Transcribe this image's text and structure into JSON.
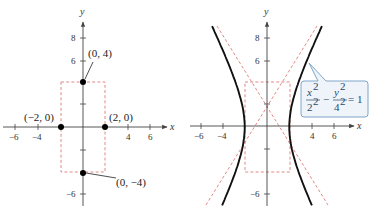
{
  "figures": [
    {
      "id": "left",
      "title": "Rectangle with vertices and co-vertices",
      "origin_px": [
        83,
        127
      ],
      "unit_px": [
        11.2,
        11.3
      ],
      "x_axis": {
        "label": "x",
        "ticks": [
          -6,
          -4,
          4,
          6
        ],
        "tick_labels": [
          "−6",
          "−4",
          "4",
          "6"
        ],
        "minor_ticks": [
          -2,
          2
        ]
      },
      "y_axis": {
        "label": "y",
        "ticks": [
          8,
          6,
          -6
        ],
        "tick_labels": [
          "8",
          "6",
          "−6"
        ],
        "minor_ticks": [
          2,
          -2
        ]
      },
      "rectangle": {
        "x": [
          -2,
          2
        ],
        "y": [
          -4,
          4
        ]
      },
      "points": [
        {
          "x": 0,
          "y": 4,
          "label": "(0, 4)"
        },
        {
          "x": -2,
          "y": 0,
          "label": "(−2, 0)"
        },
        {
          "x": 2,
          "y": 0,
          "label": "(2, 0)"
        },
        {
          "x": 0,
          "y": -4,
          "label": "(0, −4)"
        }
      ]
    },
    {
      "id": "right",
      "title": "Hyperbola with asymptotes",
      "origin_px": [
        267,
        127
      ],
      "unit_px": [
        11.15,
        11.2
      ],
      "x_axis": {
        "label": "x",
        "ticks": [
          -6,
          -4,
          4,
          6
        ],
        "tick_labels": [
          "−6",
          "−4",
          "4",
          "6"
        ],
        "minor_ticks": [
          -2,
          2
        ]
      },
      "y_axis": {
        "label": "y",
        "ticks": [
          8,
          6,
          -6
        ],
        "tick_labels": [
          "8",
          "6",
          "−6"
        ],
        "minor_ticks": [
          2,
          -2
        ]
      },
      "rectangle": {
        "x": [
          -2,
          2
        ],
        "y": [
          -4,
          4
        ]
      },
      "hyperbola": {
        "a": 2,
        "b": 4,
        "y_range": [
          -7,
          9
        ]
      },
      "asymptotes": [
        "y = 2x",
        "y = −2x"
      ],
      "equation": {
        "x_num": "x",
        "x_num_exp": "2",
        "x_den": "2",
        "x_den_exp": "2",
        "minus": "−",
        "y_num": "y",
        "y_num_exp": "2",
        "y_den": "4",
        "y_den_exp": "2",
        "equals": "= 1"
      }
    }
  ],
  "colors": {
    "axis": "#444444",
    "curve": "#111111",
    "dashed": "#e07a7a",
    "callout_bg": "#eef4fa",
    "callout_border": "#7fa6c9",
    "equation_text": "#2b4a66"
  }
}
